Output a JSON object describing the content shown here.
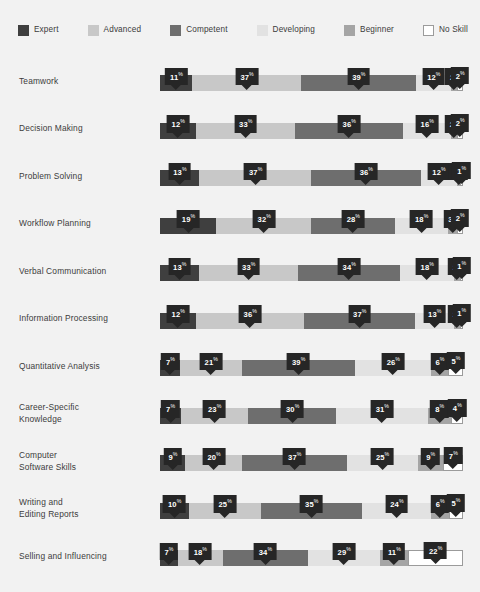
{
  "legend": {
    "items": [
      {
        "label": "Expert",
        "color": "#3f3f3f",
        "swatch": "legend-swatch-expert"
      },
      {
        "label": "Advanced",
        "color": "#c8c8c8",
        "swatch": "legend-swatch-advanced"
      },
      {
        "label": "Competent",
        "color": "#6e6e6e",
        "swatch": "legend-swatch-competent"
      },
      {
        "label": "Developing",
        "color": "#e2e2e2",
        "swatch": "legend-swatch-developing"
      },
      {
        "label": "Beginner",
        "color": "#a5a5a5",
        "swatch": "legend-swatch-beginner"
      },
      {
        "label": "No Skill",
        "color": "#ffffff",
        "swatch": "legend-swatch-noskill"
      }
    ]
  },
  "chart_data": {
    "type": "bar",
    "orientation": "horizontal",
    "stacked": true,
    "normalized": "100%",
    "title": "",
    "xlabel": "",
    "ylabel": "",
    "xlim": [
      0,
      100
    ],
    "grid": false,
    "legend_position": "top",
    "value_suffix": "%",
    "categories": [
      "Teamwork",
      "Decision Making",
      "Problem Solving",
      "Workflow Planning",
      "Verbal Communication",
      "Information Processing",
      "Quantitative Analysis",
      "Career-Specific Knowledge",
      "Computer Software Skills",
      "Writing and Editing Reports",
      "Selling and Influencing"
    ],
    "series": [
      {
        "name": "Expert",
        "color": "#3f3f3f",
        "values": [
          11,
          12,
          13,
          19,
          13,
          12,
          7,
          7,
          9,
          10,
          7
        ]
      },
      {
        "name": "Advanced",
        "color": "#c8c8c8",
        "values": [
          37,
          33,
          37,
          32,
          33,
          36,
          21,
          23,
          20,
          25,
          18
        ]
      },
      {
        "name": "Competent",
        "color": "#6e6e6e",
        "values": [
          39,
          36,
          36,
          28,
          34,
          37,
          39,
          30,
          37,
          35,
          34
        ]
      },
      {
        "name": "Developing",
        "color": "#e2e2e2",
        "values": [
          12,
          16,
          12,
          18,
          18,
          13,
          26,
          31,
          25,
          24,
          29
        ]
      },
      {
        "name": "Beginner",
        "color": "#a5a5a5",
        "values": [
          2,
          2,
          1,
          3,
          2,
          2,
          6,
          8,
          9,
          6,
          11
        ]
      },
      {
        "name": "No Skill",
        "color": "#ffffff",
        "values": [
          2,
          2,
          1,
          2,
          1,
          1,
          5,
          4,
          7,
          5,
          22
        ]
      }
    ]
  },
  "rows": [
    {
      "label": "Teamwork",
      "label_lines": [
        "Teamwork"
      ],
      "values": [
        11,
        37,
        39,
        12,
        2,
        2
      ]
    },
    {
      "label": "Decision Making",
      "label_lines": [
        "Decision Making"
      ],
      "values": [
        12,
        33,
        36,
        16,
        2,
        2
      ]
    },
    {
      "label": "Problem Solving",
      "label_lines": [
        "Problem Solving"
      ],
      "values": [
        13,
        37,
        36,
        12,
        1,
        1
      ]
    },
    {
      "label": "Workflow Planning",
      "label_lines": [
        "Workflow Planning"
      ],
      "values": [
        19,
        32,
        28,
        18,
        3,
        2
      ]
    },
    {
      "label": "Verbal Communication",
      "label_lines": [
        "Verbal Communication"
      ],
      "values": [
        13,
        33,
        34,
        18,
        2,
        1
      ]
    },
    {
      "label": "Information Processing",
      "label_lines": [
        "Information Processing"
      ],
      "values": [
        12,
        36,
        37,
        13,
        2,
        1
      ]
    },
    {
      "label": "Quantitative Analysis",
      "label_lines": [
        "Quantitative Analysis"
      ],
      "values": [
        7,
        21,
        39,
        26,
        6,
        5
      ]
    },
    {
      "label": "Career-Specific Knowledge",
      "label_lines": [
        "Career-Specific",
        "Knowledge"
      ],
      "values": [
        7,
        23,
        30,
        31,
        8,
        4
      ]
    },
    {
      "label": "Computer Software Skills",
      "label_lines": [
        "Computer",
        "Software Skills"
      ],
      "values": [
        9,
        20,
        37,
        25,
        9,
        7
      ]
    },
    {
      "label": "Writing and Editing Reports",
      "label_lines": [
        "Writing and",
        "Editing Reports"
      ],
      "values": [
        10,
        25,
        35,
        24,
        6,
        5
      ]
    },
    {
      "label": "Selling and Influencing",
      "label_lines": [
        "Selling and Influencing"
      ],
      "values": [
        7,
        18,
        34,
        29,
        11,
        22
      ]
    }
  ],
  "colors": {
    "background": "#f2f2f2",
    "callout_bg": "#262626",
    "callout_text": "#ffffff",
    "label_text": "#3c3c3c",
    "noskill_border": "#9b9b9b"
  }
}
